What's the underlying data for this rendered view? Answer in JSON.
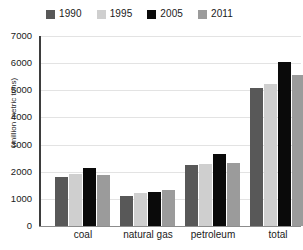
{
  "chart_data": {
    "type": "bar",
    "title": "",
    "subtitle": "",
    "xlabel": "",
    "ylabel": "(million metric tons)",
    "categories": [
      "coal",
      "natural gas",
      "petroleum",
      "total"
    ],
    "series": [
      {
        "name": "1990",
        "color": "#585858",
        "values": [
          1800,
          1100,
          2250,
          5100
        ]
      },
      {
        "name": "1995",
        "color": "#cfcfcf",
        "values": [
          1900,
          1220,
          2290,
          5250
        ]
      },
      {
        "name": "2005",
        "color": "#0a0a0a",
        "values": [
          2150,
          1250,
          2650,
          6050
        ]
      },
      {
        "name": "2011",
        "color": "#9b9b9b",
        "values": [
          1880,
          1330,
          2330,
          5550
        ]
      }
    ],
    "ylim": [
      0,
      7000
    ],
    "ytick_step": 1000,
    "yticks": [
      "0",
      "1000",
      "2000",
      "3000",
      "4000",
      "5000",
      "6000",
      "7000"
    ],
    "grid": true,
    "legend_position": "top"
  },
  "legend": {
    "items": [
      {
        "label": "1990",
        "swatch": "#585858"
      },
      {
        "label": "1995",
        "swatch": "#cfcfcf"
      },
      {
        "label": "2005",
        "swatch": "#0a0a0a"
      },
      {
        "label": "2011",
        "swatch": "#9b9b9b"
      }
    ]
  },
  "axis": {
    "y_title": "(million metric tons)"
  }
}
